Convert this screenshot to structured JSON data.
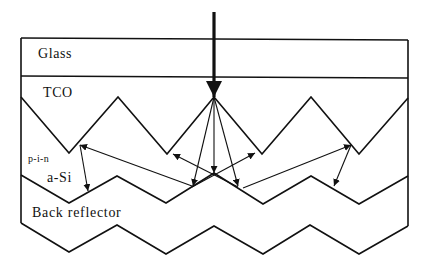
{
  "diagram": {
    "layers": [
      {
        "id": "glass",
        "label": "Glass"
      },
      {
        "id": "tco",
        "label": "TCO"
      },
      {
        "id": "asi",
        "label": "a-Si",
        "sublabel": "p-i-n"
      },
      {
        "id": "back",
        "label": "Back reflector"
      }
    ],
    "incident_light": {
      "label": "",
      "direction": "down"
    },
    "colors": {
      "stroke": "#111111",
      "background": "#ffffff"
    }
  }
}
